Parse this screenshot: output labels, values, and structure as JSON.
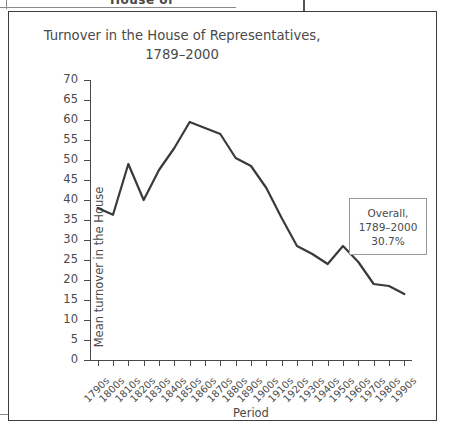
{
  "figure": {
    "title": "Turnover in the House of Representatives,\n1789–2000",
    "cropped_header_text": "House of",
    "annotation": "Overall,\n1789–2000\n30.7%"
  },
  "chart_data": {
    "type": "line",
    "title": "Turnover in the House of Representatives, 1789–2000",
    "xlabel": "Period",
    "ylabel": "Mean turnover in the House",
    "ylim": [
      0,
      70
    ],
    "ytick_step": 5,
    "yticks": [
      0,
      5,
      10,
      15,
      20,
      25,
      30,
      35,
      40,
      45,
      50,
      55,
      60,
      65,
      70
    ],
    "grid": false,
    "legend": null,
    "line_color": "#3a3a3a",
    "categories": [
      "1790s",
      "1800s",
      "1810s",
      "1820s",
      "1830s",
      "1840s",
      "1850s",
      "1860s",
      "1870s",
      "1880s",
      "1890s",
      "1900s",
      "1910s",
      "1920s",
      "1930s",
      "1940s",
      "1950s",
      "1960s",
      "1970s",
      "1980s",
      "1990s"
    ],
    "values": [
      38.0,
      36.3,
      49.0,
      40.0,
      47.5,
      53.0,
      59.5,
      58.0,
      56.5,
      50.5,
      48.5,
      43.0,
      35.5,
      28.5,
      26.5,
      24.0,
      28.5,
      24.5,
      19.0,
      18.5,
      16.5
    ],
    "annotations": [
      {
        "text": "Overall, 1789–2000 30.7%",
        "value": 30.7
      }
    ]
  }
}
